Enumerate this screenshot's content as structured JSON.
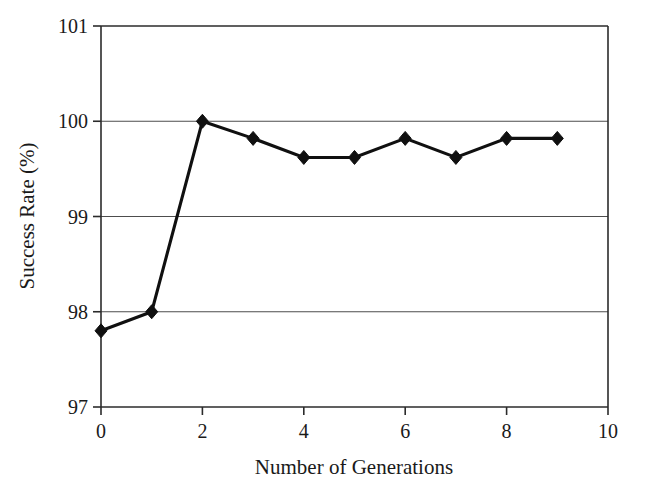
{
  "chart_data": {
    "type": "line",
    "title": "",
    "xlabel": "Number of Generations",
    "ylabel": "Success Rate (%)",
    "xlim": [
      0,
      10
    ],
    "ylim": [
      97,
      101
    ],
    "xticks": [
      0,
      2,
      4,
      6,
      8,
      10
    ],
    "xtick_labels": [
      "0",
      "2",
      "4",
      "6",
      "8",
      "10"
    ],
    "yticks": [
      97,
      98,
      99,
      100,
      101
    ],
    "ytick_labels": [
      "97",
      "98",
      "99",
      "100",
      "101"
    ],
    "grid": "horizontal",
    "legend": "none",
    "marker": "diamond",
    "marker_color": "#101010",
    "line_color": "#101010",
    "x": [
      0,
      1,
      2,
      3,
      4,
      5,
      6,
      7,
      8,
      9
    ],
    "values": [
      97.8,
      98.0,
      100.0,
      99.82,
      99.62,
      99.62,
      99.82,
      99.62,
      99.82,
      99.82
    ],
    "series": [
      {
        "name": "Success Rate",
        "x": [
          0,
          1,
          2,
          3,
          4,
          5,
          6,
          7,
          8,
          9
        ],
        "values": [
          97.8,
          98.0,
          100.0,
          99.82,
          99.62,
          99.62,
          99.82,
          99.62,
          99.82,
          99.82
        ]
      }
    ]
  },
  "axes": {
    "x_title": "Number of Generations",
    "y_title": "Success Rate (%)",
    "x_tick_labels": [
      "0",
      "2",
      "4",
      "6",
      "8",
      "10"
    ],
    "y_tick_labels": [
      "97",
      "98",
      "99",
      "100",
      "101"
    ]
  },
  "colors": {
    "line": "#101010",
    "marker": "#101010",
    "grid": "#4d4d4d",
    "frame": "#2b2b2b",
    "text": "#1a1a1a",
    "background": "#ffffff"
  }
}
